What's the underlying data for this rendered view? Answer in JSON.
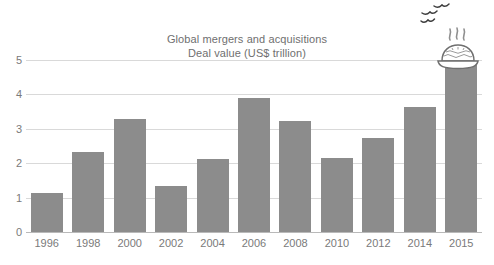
{
  "chart_data": {
    "type": "bar",
    "title": "Global mergers and acquisitions",
    "subtitle": "Deal value (US$ trillion)",
    "xlabel": "",
    "ylabel": "",
    "categories": [
      "1996",
      "1998",
      "2000",
      "2002",
      "2004",
      "2006",
      "2008",
      "2010",
      "2012",
      "2014",
      "2015"
    ],
    "values": [
      1.13,
      2.33,
      3.28,
      1.35,
      2.12,
      3.9,
      3.22,
      2.15,
      2.73,
      3.62,
      4.97
    ],
    "ylim": [
      0,
      5
    ],
    "yticks": [
      "0",
      "1",
      "2",
      "3",
      "4",
      "5"
    ],
    "ytick_values": [
      0,
      1,
      2,
      3,
      4,
      5
    ],
    "grid": true,
    "legend": "none",
    "bar_color": "#8c8c8c",
    "grid_color": "#d9d9d9",
    "text_color": "#7a7a7a"
  },
  "decorations": {
    "pie_icon_name": "steaming-pie-icon",
    "birds_icon_name": "flying-birds-icon"
  }
}
